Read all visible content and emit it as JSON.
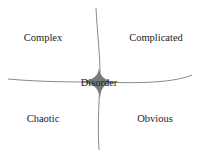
{
  "diagram": {
    "title": "",
    "colors": {
      "line": "#8a8a8a",
      "center_fill": "#7a7a7a",
      "text": "#222222"
    },
    "quadrants": [
      {
        "id": "complex",
        "label": "Complex",
        "x": 43,
        "y": 37
      },
      {
        "id": "complicated",
        "label": "Complicated",
        "x": 156,
        "y": 37
      },
      {
        "id": "chaotic",
        "label": "Chaotic",
        "x": 43,
        "y": 118
      },
      {
        "id": "obvious",
        "label": "Obvious",
        "x": 155,
        "y": 118
      }
    ],
    "center": {
      "id": "disorder",
      "label": "Disorder",
      "x": 99,
      "y": 82
    }
  }
}
